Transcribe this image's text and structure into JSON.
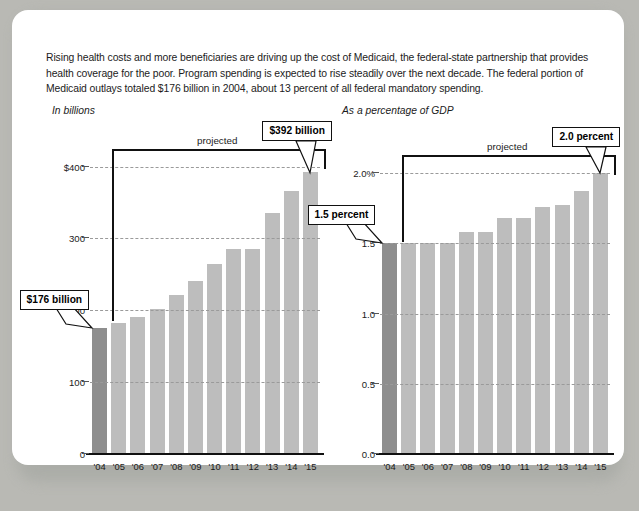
{
  "caption": "Rising health costs and more beneficiaries are driving up the cost of Medicaid, the federal-state partnership that provides health coverage for the poor. Program spending is expected to rise steadily over the next decade. The federal portion of Medicaid outlays totaled $176 billion in 2004, about 13 percent of all federal mandatory spending.",
  "colors": {
    "bar": "#bdbdbd",
    "bar_highlight": "#8e8e8e",
    "axis": "#111111",
    "grid": "#9a9a9a",
    "card": "#ffffff",
    "backdrop": "#b9bbb6"
  },
  "chart_data": [
    {
      "type": "bar",
      "id": "medicaid-outlays-billions",
      "title": "In billions",
      "xlabel": "",
      "ylabel": "",
      "ylim": [
        0,
        430
      ],
      "grid": true,
      "legend": "none",
      "categories": [
        "'04",
        "'05",
        "'06",
        "'07",
        "'08",
        "'09",
        "'10",
        "'11",
        "'12",
        "'13",
        "'14",
        "'15"
      ],
      "values": [
        176,
        183,
        191,
        202,
        221,
        241,
        265,
        285,
        285,
        336,
        366,
        392
      ],
      "yticks": [
        "$400",
        "300",
        "200",
        "100",
        "0"
      ],
      "ytick_values": [
        400,
        300,
        200,
        100,
        0
      ],
      "highlight_index": 0,
      "projected_label": "projected",
      "callouts": [
        {
          "text": "$176 billion",
          "target_index": 0
        },
        {
          "text": "$392 billion",
          "target_index": 11
        }
      ]
    },
    {
      "type": "bar",
      "id": "medicaid-share-of-gdp",
      "title": "As a percentage of GDP",
      "xlabel": "",
      "ylabel": "",
      "ylim": [
        0,
        2.2
      ],
      "grid": true,
      "legend": "none",
      "categories": [
        "'04",
        "'05",
        "'06",
        "'07",
        "'08",
        "'09",
        "'10",
        "'11",
        "'12",
        "'13",
        "'14",
        "'15"
      ],
      "values": [
        1.5,
        1.5,
        1.5,
        1.5,
        1.58,
        1.58,
        1.68,
        1.68,
        1.76,
        1.77,
        1.87,
        2.0
      ],
      "yticks": [
        "2.0%",
        "1.5",
        "1.0",
        "0.5",
        "0.0"
      ],
      "ytick_values": [
        2.0,
        1.5,
        1.0,
        0.5,
        0.0
      ],
      "highlight_index": 0,
      "projected_label": "projected",
      "callouts": [
        {
          "text": "1.5 percent",
          "target_index": 0
        },
        {
          "text": "2.0 percent",
          "target_index": 11
        }
      ]
    }
  ]
}
